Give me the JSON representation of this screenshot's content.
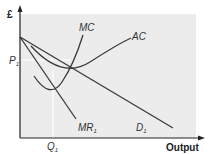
{
  "diagram": {
    "type": "economics-cost-revenue-diagram",
    "y_axis_label": "£",
    "x_axis_label": "Output",
    "price_label": "P",
    "price_subscript": "1",
    "quantity_label": "Q",
    "quantity_subscript": "1",
    "curves": [
      {
        "id": "MC",
        "label": "MC",
        "subscript": ""
      },
      {
        "id": "AC",
        "label": "AC",
        "subscript": ""
      },
      {
        "id": "MR",
        "label": "MR",
        "subscript": "1"
      },
      {
        "id": "D",
        "label": "D",
        "subscript": "1"
      }
    ],
    "colors": {
      "plot_background": "#ececec",
      "curve": "#3a3a3a",
      "axis": "#222222",
      "guide_line": "#ffffff"
    }
  }
}
